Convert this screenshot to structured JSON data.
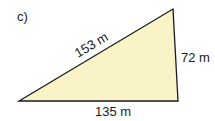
{
  "figure": {
    "part_label": "c)",
    "shape": "right triangle",
    "fill_color": "#fbf3c8",
    "stroke_color": "#1a1a1a",
    "sides": {
      "hypotenuse": "153 m",
      "vertical": "72 m",
      "base": "135 m"
    }
  }
}
